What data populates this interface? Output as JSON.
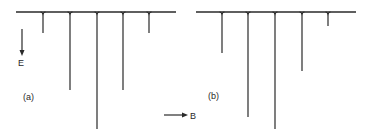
{
  "figure": {
    "ink_color": "#2a2a2a",
    "background": "#ffffff",
    "axes": {
      "energy_label": "E",
      "field_label": "B"
    },
    "panels": [
      {
        "label": "(a)",
        "baseline": {
          "x1": 16,
          "x2": 176,
          "y": 12
        },
        "lines": [
          {
            "x": 43,
            "depth": 33
          },
          {
            "x": 70,
            "depth": 90
          },
          {
            "x": 97,
            "depth": 129
          },
          {
            "x": 123,
            "depth": 90
          },
          {
            "x": 149,
            "depth": 33
          }
        ],
        "relative_intensities": [
          1,
          3,
          5,
          3,
          1
        ]
      },
      {
        "label": "(b)",
        "baseline": {
          "x1": 196,
          "x2": 356,
          "y": 12
        },
        "lines": [
          {
            "x": 222,
            "depth": 53
          },
          {
            "x": 248,
            "depth": 117
          },
          {
            "x": 275,
            "depth": 129
          },
          {
            "x": 302,
            "depth": 71
          },
          {
            "x": 328,
            "depth": 26
          }
        ],
        "relative_intensities": [
          2,
          5.5,
          6,
          3,
          0.7
        ]
      }
    ]
  }
}
